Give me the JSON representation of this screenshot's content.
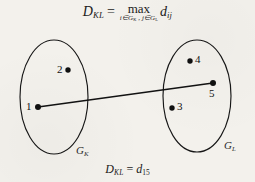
{
  "figure": {
    "background_color": "#f3f1ec",
    "ink_color": "#1a1a1a",
    "top_formula": {
      "lhs_symbol": "D",
      "lhs_subscript": "KL",
      "equals": "=",
      "operator": "max",
      "operator_condition": "i∈Gₖ , j∈Gʟ",
      "condition_parts": {
        "left": "i∈G",
        "left_sub": "K",
        "separator": " , ",
        "right": "j∈G",
        "right_sub": "L"
      },
      "rhs_symbol": "d",
      "rhs_subscript": "ij",
      "plain_text": "D_KL = max_{i∈G_K , j∈G_L} d_ij"
    },
    "bottom_formula": {
      "lhs_symbol": "D",
      "lhs_subscript": "KL",
      "equals": "=",
      "rhs_symbol": "d",
      "rhs_subscript": "15",
      "plain_text": "D_KL = d_15"
    },
    "clusters": [
      {
        "name": "cluster-gk",
        "label_symbol": "G",
        "label_subscript": "K",
        "label_plain": "G_K",
        "label_x": 80,
        "label_y": 146,
        "ellipse": {
          "cx": 54,
          "cy": 97,
          "rx": 34,
          "ry": 57
        },
        "points": [
          {
            "id": "2",
            "label": "2",
            "x": 68,
            "y": 70,
            "label_x": 58,
            "label_y": 65,
            "label_side": "left"
          },
          {
            "id": "1",
            "label": "1",
            "x": 38,
            "y": 107,
            "label_x": 27,
            "label_y": 102,
            "label_side": "left"
          }
        ]
      },
      {
        "name": "cluster-gl",
        "label_symbol": "G",
        "label_subscript": "L",
        "label_plain": "G_L",
        "label_x": 228,
        "label_y": 141,
        "ellipse": {
          "cx": 197,
          "cy": 96,
          "rx": 34,
          "ry": 56
        },
        "points": [
          {
            "id": "4",
            "label": "4",
            "x": 190,
            "y": 61,
            "label_x": 195,
            "label_y": 55,
            "label_side": "right"
          },
          {
            "id": "5",
            "label": "5",
            "x": 213,
            "y": 83,
            "label_x": 209,
            "label_y": 89,
            "label_side": "below"
          },
          {
            "id": "3",
            "label": "3",
            "x": 172,
            "y": 108,
            "label_x": 177,
            "label_y": 102,
            "label_side": "right"
          }
        ]
      }
    ],
    "connector": {
      "name": "max-distance-line",
      "from_point": "1",
      "to_point": "5",
      "x1": 38,
      "y1": 107,
      "x2": 213,
      "y2": 83
    }
  }
}
